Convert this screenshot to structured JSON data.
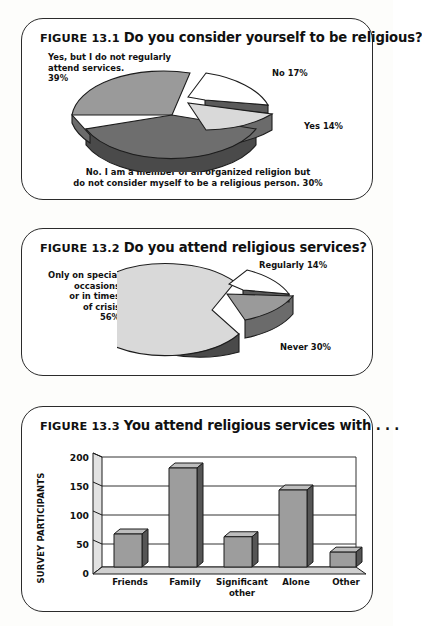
{
  "page": {
    "background": "#fdfdfb",
    "card_border": "#2b2b2b"
  },
  "palette": {
    "slice_light": "#d9d9d9",
    "slice_mid": "#9a9a9a",
    "slice_dark": "#6e6e6e",
    "slice_white": "#ffffff",
    "side_dark": "#4a4a4a",
    "side_mid": "#6b6b6b",
    "outline": "#1c1c1c",
    "bar_face": "#9d9d9d",
    "bar_top": "#bdbdbd",
    "bar_side": "#555555",
    "grid": "#333333"
  },
  "figures": [
    {
      "id": "figure-13-1",
      "number": "FIGURE 13.1",
      "question": "Do you consider yourself to be religious?",
      "labels": {
        "left": "Yes, but I do not regularly\nattend services.\n39%",
        "top_right": "No 17%",
        "right": "Yes 14%",
        "bottom": "No. I am a member of an organized religion but\ndo not consider myself to be a religious person. 30%"
      }
    },
    {
      "id": "figure-13-2",
      "number": "FIGURE 13.2",
      "question": "Do you attend religious services?",
      "labels": {
        "left": "Only on special\noccasions\nor in times\nof crisis\n56%",
        "top_right": "Regularly 14%",
        "bottom_right": "Never 30%"
      }
    },
    {
      "id": "figure-13-3",
      "number": "FIGURE 13.3",
      "question": "You attend religious services with . . ."
    }
  ],
  "chart_data": [
    {
      "type": "pie",
      "id": "figure-13-1-pie",
      "title": "Do you consider yourself to be religious?",
      "figure": "FIGURE 13.1",
      "exploded": true,
      "three_d": true,
      "labels": [
        "Yes, but I do not regularly attend services.",
        "No",
        "Yes",
        "No. I am a member of an organized religion but do not consider myself to be a religious person."
      ],
      "values": [
        39,
        17,
        14,
        30
      ],
      "value_suffix": "%",
      "slice_colors": [
        "#9a9a9a",
        "#ffffff",
        "#d9d9d9",
        "#6e6e6e"
      ],
      "legend": "labels placed around the pie"
    },
    {
      "type": "pie",
      "id": "figure-13-2-pie",
      "title": "Do you attend religious services?",
      "figure": "FIGURE 13.2",
      "exploded": true,
      "three_d": true,
      "labels": [
        "Only on special occasions or in times of crisis",
        "Regularly",
        "Never"
      ],
      "values": [
        56,
        14,
        30
      ],
      "value_suffix": "%",
      "slice_colors": [
        "#d9d9d9",
        "#ffffff",
        "#9a9a9a"
      ],
      "legend": "labels placed around the pie"
    },
    {
      "type": "bar",
      "id": "figure-13-3-bar",
      "title": "You attend religious services with . . .",
      "figure": "FIGURE 13.3",
      "categories": [
        "Friends",
        "Family",
        "Significant other",
        "Alone",
        "Other"
      ],
      "values": [
        60,
        180,
        55,
        140,
        27
      ],
      "xlabel": "",
      "ylabel": "SURVEY PARTICIPANTS",
      "ylim": [
        0,
        200
      ],
      "yticks": [
        0,
        50,
        100,
        150,
        200
      ],
      "grid": true,
      "three_d": true,
      "legend": "none"
    }
  ]
}
